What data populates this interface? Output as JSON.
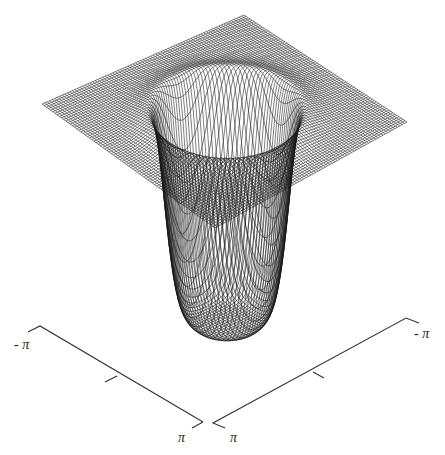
{
  "chart_data": {
    "type": "surface",
    "title": "",
    "x_axis": {
      "range": [
        "-π",
        "π"
      ],
      "ticks": [
        "-π",
        "0",
        "π"
      ],
      "tick_labels": [
        "- π",
        "π"
      ]
    },
    "y_axis": {
      "range": [
        "-π",
        "π"
      ],
      "ticks": [
        "-π",
        "0",
        "π"
      ],
      "tick_labels": [
        "π",
        "- π"
      ]
    },
    "grid_resolution": 80,
    "function": "z = -depth * exp(-(r/width)^8), r = sqrt(x^2+y^2)",
    "depth": 1.0,
    "well_width": 1.55,
    "mesh_color": "#1a1a1a",
    "background": "#ffffff"
  },
  "axes": {
    "left_axis": {
      "start_label": "- π",
      "end_label": "π"
    },
    "right_axis": {
      "start_label": "π",
      "end_label": "- π"
    }
  }
}
